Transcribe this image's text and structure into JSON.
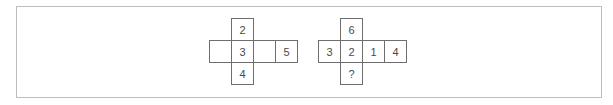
{
  "nets": [
    {
      "name": "left-net",
      "cells": [
        {
          "label": "2",
          "x": 231,
          "y": 18
        },
        {
          "label": "",
          "x": 209,
          "y": 40
        },
        {
          "label": "3",
          "x": 231,
          "y": 40
        },
        {
          "label": "",
          "x": 253,
          "y": 40
        },
        {
          "label": "5",
          "x": 275,
          "y": 40
        },
        {
          "label": "4",
          "x": 231,
          "y": 62
        }
      ]
    },
    {
      "name": "right-net",
      "cells": [
        {
          "label": "6",
          "x": 340,
          "y": 18
        },
        {
          "label": "3",
          "x": 318,
          "y": 40
        },
        {
          "label": "2",
          "x": 340,
          "y": 40
        },
        {
          "label": "1",
          "x": 362,
          "y": 40
        },
        {
          "label": "4",
          "x": 384,
          "y": 40
        },
        {
          "label": "?",
          "x": 340,
          "y": 62
        }
      ]
    }
  ]
}
